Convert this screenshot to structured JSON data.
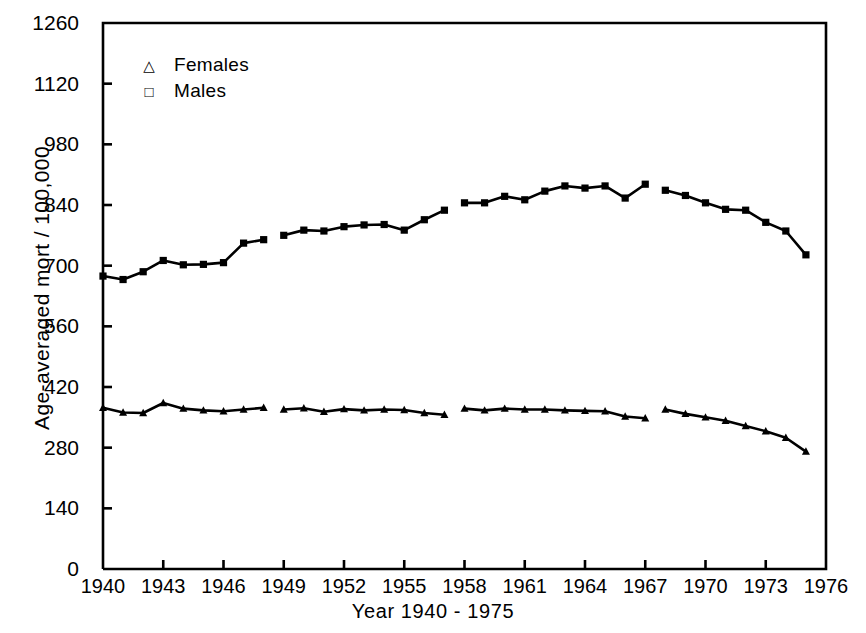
{
  "chart_data": {
    "type": "line",
    "title": "",
    "xlabel": "Year  1940 - 1975",
    "ylabel": "Age-averaged mort / 100,000",
    "xlim": [
      1940,
      1976
    ],
    "ylim": [
      0,
      1260
    ],
    "grid": false,
    "legend_position": "top-left",
    "xticks": [
      1940,
      1943,
      1946,
      1949,
      1952,
      1955,
      1958,
      1961,
      1964,
      1967,
      1970,
      1973,
      1976
    ],
    "xtick_labels": [
      "1940",
      "1943",
      "1946",
      "1949",
      "1952",
      "1955",
      "1958",
      "1961",
      "1964",
      "1967",
      "1970",
      "1973",
      "1976"
    ],
    "yticks": [
      0,
      140,
      280,
      420,
      560,
      700,
      840,
      980,
      1120,
      1260
    ],
    "ytick_labels": [
      "0",
      "140",
      "280",
      "420",
      "560",
      "700",
      "840",
      "980",
      "1120",
      "1260"
    ],
    "series": [
      {
        "name": "Males",
        "marker": "square",
        "x": [
          1940,
          1941,
          1942,
          1943,
          1944,
          1945,
          1946,
          1947,
          1948,
          1949,
          1950,
          1951,
          1952,
          1953,
          1954,
          1955,
          1956,
          1957,
          1958,
          1959,
          1960,
          1961,
          1962,
          1963,
          1964,
          1965,
          1966,
          1967,
          1968,
          1969,
          1970,
          1971,
          1972,
          1973,
          1974,
          1975
        ],
        "values": [
          676,
          668,
          686,
          712,
          702,
          703,
          707,
          752,
          760,
          770,
          782,
          780,
          790,
          794,
          795,
          782,
          806,
          828,
          845,
          845,
          860,
          852,
          872,
          884,
          879,
          884,
          856,
          888,
          874,
          862,
          845,
          830,
          828,
          800,
          780,
          725
        ],
        "breaks_after": [
          1948,
          1957,
          1967
        ]
      },
      {
        "name": "Females",
        "marker": "triangle",
        "x": [
          1940,
          1941,
          1942,
          1943,
          1944,
          1945,
          1946,
          1947,
          1948,
          1949,
          1950,
          1951,
          1952,
          1953,
          1954,
          1955,
          1956,
          1957,
          1958,
          1959,
          1960,
          1961,
          1962,
          1963,
          1964,
          1965,
          1966,
          1967,
          1968,
          1969,
          1970,
          1971,
          1972,
          1973,
          1974,
          1975
        ],
        "values": [
          372,
          361,
          360,
          383,
          370,
          366,
          364,
          368,
          372,
          368,
          371,
          363,
          369,
          366,
          368,
          367,
          360,
          356,
          370,
          366,
          370,
          368,
          368,
          366,
          365,
          364,
          352,
          348,
          368,
          358,
          350,
          342,
          330,
          318,
          303,
          271
        ],
        "breaks_after": [
          1948,
          1957,
          1967
        ]
      }
    ]
  },
  "legend": {
    "entries": [
      {
        "marker_glyph": "△",
        "label": "Females"
      },
      {
        "marker_glyph": "□",
        "label": "Males"
      }
    ]
  },
  "axes": {
    "y_title": "Age-averaged mort / 100,000",
    "x_title": "Year  1940 - 1975"
  },
  "colors": {
    "ink": "#000000",
    "background": "#ffffff"
  }
}
